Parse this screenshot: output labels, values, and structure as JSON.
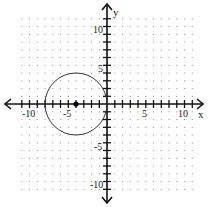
{
  "chart_data": {
    "type": "scatter",
    "title": "",
    "xlabel": "x",
    "ylabel": "y",
    "xlim": [
      -11,
      11
    ],
    "ylim": [
      -11,
      11
    ],
    "grid": true,
    "grid_style": "dotted",
    "x_tick_labels": [
      "-10",
      "-5",
      "5",
      "10"
    ],
    "y_tick_labels": [
      "10",
      "5",
      "-5",
      "-10"
    ],
    "shapes": [
      {
        "type": "circle",
        "center": [
          -4,
          0
        ],
        "radius": 4,
        "color": "#222222"
      }
    ],
    "points": [
      {
        "x": -4,
        "y": 0,
        "label": "center",
        "color": "#000000"
      }
    ]
  },
  "axes": {
    "x_label": "x",
    "y_label": "y",
    "x_ticks": {
      "neg10": "-10",
      "neg5": "-5",
      "pos5": "5",
      "pos10": "10"
    },
    "y_ticks": {
      "pos10": "10",
      "pos5": "5",
      "neg5": "-5",
      "neg10": "-10"
    }
  }
}
